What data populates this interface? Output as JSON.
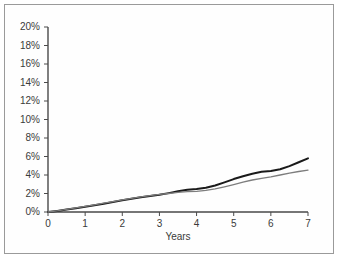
{
  "figure": {
    "width": 340,
    "height": 260,
    "background": "#ffffff",
    "border_color": "#9a9a9a"
  },
  "chart_data": {
    "type": "line",
    "title": "",
    "subtitle": "",
    "xlabel": "Years",
    "ylabel": "",
    "xlim": [
      0,
      7
    ],
    "ylim": [
      0,
      20
    ],
    "grid": false,
    "legend": null,
    "legend_position": "none",
    "x_tick_labels": [
      "0",
      "1",
      "2",
      "3",
      "4",
      "5",
      "6",
      "7"
    ],
    "x_ticks": [
      0,
      1,
      2,
      3,
      4,
      5,
      6,
      7
    ],
    "y_tick_labels": [
      "0%",
      "2%",
      "4%",
      "6%",
      "8%",
      "10%",
      "12%",
      "14%",
      "16%",
      "18%",
      "20%"
    ],
    "y_ticks": [
      0,
      2,
      4,
      6,
      8,
      10,
      12,
      14,
      16,
      18,
      20
    ],
    "y_unit": "%",
    "series": [
      {
        "name": "upper-series",
        "color": "#1a1a1a",
        "width": 2.0,
        "x": [
          0,
          0.25,
          0.5,
          0.75,
          1,
          1.25,
          1.5,
          1.75,
          2,
          2.25,
          2.5,
          2.75,
          3,
          3.25,
          3.5,
          3.75,
          4,
          4.25,
          4.5,
          4.75,
          5,
          5.25,
          5.5,
          5.75,
          6,
          6.25,
          6.5,
          6.75,
          7
        ],
        "values": [
          0.0,
          0.12,
          0.26,
          0.41,
          0.56,
          0.72,
          0.9,
          1.08,
          1.26,
          1.44,
          1.6,
          1.74,
          1.86,
          2.04,
          2.24,
          2.4,
          2.48,
          2.62,
          2.86,
          3.2,
          3.56,
          3.86,
          4.14,
          4.36,
          4.44,
          4.62,
          4.96,
          5.38,
          5.8
        ]
      },
      {
        "name": "lower-series",
        "color": "#7d7d7d",
        "width": 1.3,
        "x": [
          0,
          0.25,
          0.5,
          0.75,
          1,
          1.25,
          1.5,
          1.75,
          2,
          2.25,
          2.5,
          2.75,
          3,
          3.25,
          3.5,
          3.75,
          4,
          4.25,
          4.5,
          4.75,
          5,
          5.25,
          5.5,
          5.75,
          6,
          6.25,
          6.5,
          6.75,
          7
        ],
        "values": [
          0.0,
          0.13,
          0.28,
          0.44,
          0.6,
          0.77,
          0.95,
          1.12,
          1.3,
          1.48,
          1.64,
          1.78,
          1.9,
          2.0,
          2.12,
          2.2,
          2.24,
          2.34,
          2.5,
          2.72,
          2.96,
          3.22,
          3.46,
          3.64,
          3.8,
          4.0,
          4.2,
          4.38,
          4.52
        ]
      }
    ]
  }
}
